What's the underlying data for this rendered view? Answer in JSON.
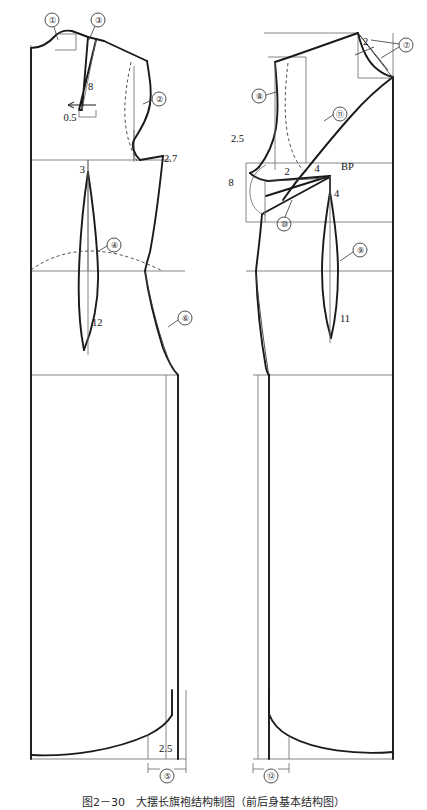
{
  "figure": {
    "caption": "图2－30　大摆长旗袍结构制图（前后身基本结构图）",
    "units": "cm"
  },
  "panels": {
    "back": {
      "name": "后片",
      "label": "Back bodice / skirt block"
    },
    "front": {
      "name": "前片",
      "label": "Front bodice / skirt block"
    }
  },
  "dimensions": {
    "back_shoulder_dart_length": "8",
    "back_shoulder_dart_shift": "0.5",
    "back_armhole_notch": "2.7",
    "back_waist_dart_top": "3",
    "back_waist_dart_length": "12",
    "back_hem_extension": "2.5",
    "front_neck_corner": "2",
    "front_shoulder_drop": "2.5",
    "front_side_value": "2",
    "front_side_dart_length": "8",
    "front_bust_dart_upper": "4",
    "front_bust_dart_lower": "4",
    "front_waist_dart_length": "11",
    "bust_point": "BP"
  },
  "markers": [
    {
      "id": "1",
      "glyph": "①",
      "label": "back-neckline"
    },
    {
      "id": "2",
      "glyph": "②",
      "label": "back-armhole"
    },
    {
      "id": "3",
      "glyph": "③",
      "label": "back-shoulder-dart"
    },
    {
      "id": "4",
      "glyph": "④",
      "label": "back-waist-dart"
    },
    {
      "id": "5",
      "glyph": "⑤",
      "label": "back-hem-flare"
    },
    {
      "id": "6",
      "glyph": "⑥",
      "label": "back-side-seam"
    },
    {
      "id": "7",
      "glyph": "⑦",
      "label": "front-neckline-corner"
    },
    {
      "id": "8",
      "glyph": "⑧",
      "label": "front-shoulder-seam"
    },
    {
      "id": "9",
      "glyph": "⑨",
      "label": "front-waist-dart"
    },
    {
      "id": "10",
      "glyph": "⑩",
      "label": "front-side-dart"
    },
    {
      "id": "11",
      "glyph": "⑪",
      "label": "front-armhole"
    },
    {
      "id": "12",
      "glyph": "⑫",
      "label": "front-hem-flare"
    }
  ],
  "colors": {
    "outline": "#1a1a1a",
    "construction": "#6f6f6f",
    "dashed": "#4a4a4a",
    "background": "#ffffff"
  }
}
